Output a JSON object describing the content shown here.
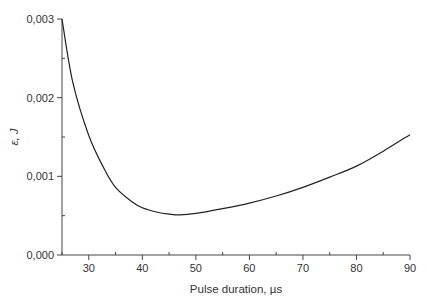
{
  "chart_data": {
    "type": "line",
    "title": "",
    "xlabel": "Pulse duration, µs",
    "ylabel": "ε, J",
    "xlim": [
      25,
      90
    ],
    "ylim": [
      0,
      0.003
    ],
    "grid": false,
    "legend": null,
    "x_ticks": [
      30,
      40,
      50,
      60,
      70,
      80,
      90
    ],
    "x_tick_labels": [
      "30",
      "40",
      "50",
      "60",
      "70",
      "80",
      "90"
    ],
    "x_minor_ticks": [
      25,
      35,
      45,
      55,
      65,
      75,
      85
    ],
    "y_ticks": [
      0,
      0.001,
      0.002,
      0.003
    ],
    "y_tick_labels": [
      "0,000",
      "0,001",
      "0,002",
      "0,003"
    ],
    "y_minor_ticks": [
      0.0005,
      0.0015,
      0.0025
    ],
    "series": [
      {
        "name": "ε",
        "x": [
          25,
          27,
          30,
          33,
          35,
          38,
          40,
          43,
          45,
          47,
          50,
          55,
          60,
          65,
          70,
          75,
          80,
          85,
          90
        ],
        "values": [
          0.003,
          0.0022,
          0.00152,
          0.00108,
          0.00086,
          0.00068,
          0.0006,
          0.00054,
          0.00052,
          0.00051,
          0.00053,
          0.00059,
          0.00066,
          0.00075,
          0.00086,
          0.00099,
          0.00113,
          0.00132,
          0.00153
        ]
      }
    ],
    "colors": {
      "line": "#222222",
      "axis": "#444444",
      "text": "#333333"
    }
  }
}
